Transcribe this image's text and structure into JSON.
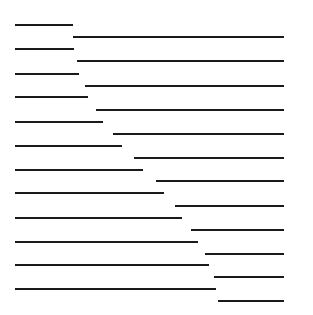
{
  "diagram": {
    "title": "",
    "stroke_color": "#1a1a1a",
    "background_color": "#ffffff",
    "stroke_width": 2.2,
    "left_segments": [
      {
        "y": 25,
        "x1": 15,
        "x2": 73
      },
      {
        "y": 49,
        "x1": 15,
        "x2": 74
      },
      {
        "y": 74,
        "x1": 15,
        "x2": 79
      },
      {
        "y": 97,
        "x1": 15,
        "x2": 88
      },
      {
        "y": 122,
        "x1": 15,
        "x2": 103
      },
      {
        "y": 146,
        "x1": 15,
        "x2": 122
      },
      {
        "y": 170,
        "x1": 15,
        "x2": 143
      },
      {
        "y": 193,
        "x1": 15,
        "x2": 164
      },
      {
        "y": 218,
        "x1": 15,
        "x2": 182
      },
      {
        "y": 242,
        "x1": 15,
        "x2": 198
      },
      {
        "y": 265,
        "x1": 15,
        "x2": 209
      },
      {
        "y": 289,
        "x1": 15,
        "x2": 216
      }
    ],
    "right_segments": [
      {
        "y": 37,
        "x1": 73,
        "x2": 284
      },
      {
        "y": 61,
        "x1": 77,
        "x2": 284
      },
      {
        "y": 86,
        "x1": 85,
        "x2": 284
      },
      {
        "y": 110,
        "x1": 96,
        "x2": 284
      },
      {
        "y": 134,
        "x1": 113,
        "x2": 284
      },
      {
        "y": 158,
        "x1": 134,
        "x2": 284
      },
      {
        "y": 181,
        "x1": 156,
        "x2": 284
      },
      {
        "y": 206,
        "x1": 175,
        "x2": 284
      },
      {
        "y": 230,
        "x1": 191,
        "x2": 284
      },
      {
        "y": 254,
        "x1": 205,
        "x2": 284
      },
      {
        "y": 277,
        "x1": 214,
        "x2": 284
      },
      {
        "y": 301,
        "x1": 218,
        "x2": 284
      }
    ]
  }
}
